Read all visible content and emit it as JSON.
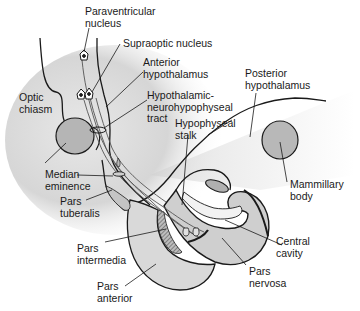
{
  "diagram": {
    "type": "anatomical",
    "colors": {
      "background": "#ffffff",
      "tissue_shade": "#d4d4d4",
      "tissue_light": "#ececec",
      "structure_fill": "#b8b8b8",
      "outline": "#1a1a1a",
      "text": "#1a1a1a"
    },
    "labels": [
      {
        "id": "paraventricular-nucleus",
        "text": "Paraventricular\nnucleus"
      },
      {
        "id": "supraoptic-nucleus",
        "text": "Supraoptic nucleus"
      },
      {
        "id": "anterior-hypothalamus",
        "text": "Anterior\nhypothalamus"
      },
      {
        "id": "hypothalamic-neurohypophyseal-tract",
        "text": "Hypothalamic-\nneurohypophyseal\ntract"
      },
      {
        "id": "posterior-hypothalamus",
        "text": "Posterior\nhypothalamus"
      },
      {
        "id": "optic-chiasm",
        "text": "Optic\nchiasm"
      },
      {
        "id": "hypophyseal-stalk",
        "text": "Hypophyseal\nstalk"
      },
      {
        "id": "median-eminence",
        "text": "Median\neminence"
      },
      {
        "id": "pars-tuberalis",
        "text": "Pars\ntuberalis"
      },
      {
        "id": "mammillary-body",
        "text": "Mammillary\nbody"
      },
      {
        "id": "central-cavity",
        "text": "Central\ncavity"
      },
      {
        "id": "pars-intermedia",
        "text": "Pars\nintermedia"
      },
      {
        "id": "pars-nervosa",
        "text": "Pars\nnervosa"
      },
      {
        "id": "pars-anterior",
        "text": "Pars\nanterior"
      }
    ]
  }
}
